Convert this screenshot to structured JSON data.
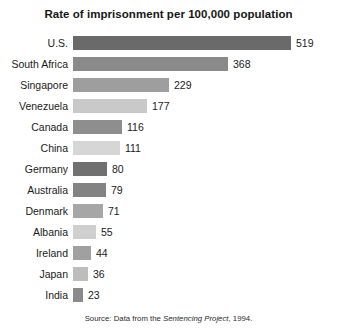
{
  "chart_data": {
    "type": "bar",
    "orientation": "horizontal",
    "title": "Rate of imprisonment per 100,000 population",
    "xlabel": "",
    "ylabel": "",
    "xlim": [
      0,
      519
    ],
    "grid": false,
    "legend": "none",
    "categories": [
      "U.S.",
      "South Africa",
      "Singapore",
      "Venezuela",
      "Canada",
      "China",
      "Germany",
      "Australia",
      "Denmark",
      "Albania",
      "Ireland",
      "Japan",
      "India"
    ],
    "values": [
      519,
      368,
      229,
      177,
      116,
      111,
      80,
      79,
      71,
      55,
      44,
      36,
      23
    ],
    "value_labels": [
      "519",
      "368",
      "229",
      "177",
      "116",
      "111",
      "80",
      "79",
      "71",
      "55",
      "44",
      "36",
      "23"
    ],
    "bar_colors": [
      "#6a6a6a",
      "#8a8a8a",
      "#9e9e9e",
      "#c9c9c9",
      "#8e8e8e",
      "#d6d6d6",
      "#707070",
      "#838383",
      "#a6a6a6",
      "#cfcfcf",
      "#a0a0a0",
      "#bdbdbd",
      "#8a8a8a"
    ],
    "source_prefix": "Source: Data from the ",
    "source_italic": "Sentencing Project",
    "source_suffix": ", 1994."
  },
  "colors": {
    "background": "#ffffff",
    "text": "#1a1a1a",
    "title": "#161616"
  }
}
